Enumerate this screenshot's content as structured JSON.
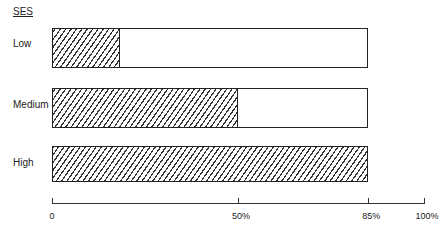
{
  "chart_data": {
    "type": "bar",
    "orientation": "horizontal",
    "title": "",
    "legend_title": "SES",
    "categories": [
      "Low",
      "Medium",
      "High"
    ],
    "series": [
      {
        "name": "hatched (filled)",
        "values": [
          18,
          50,
          85
        ]
      },
      {
        "name": "bar total",
        "values": [
          85,
          85,
          85
        ]
      }
    ],
    "xlabel": "",
    "ylabel": "SES",
    "xlim": [
      0,
      100
    ],
    "x_ticks": [
      0,
      50,
      85,
      100
    ],
    "x_tick_labels": [
      "0",
      "50%",
      "85%",
      "100%"
    ],
    "grid": false,
    "legend_position": "none"
  },
  "labels": {
    "legend_title": "SES",
    "categories": [
      "Low",
      "Medium",
      "High"
    ],
    "ticks": [
      "0",
      "50%",
      "85%",
      "100%"
    ]
  },
  "layout": {
    "axis_x0": 52,
    "axis_x100": 424,
    "bars": [
      {
        "top": 28,
        "height": 40
      },
      {
        "top": 88,
        "height": 40
      },
      {
        "top": 146,
        "height": 36
      }
    ],
    "label_tops": [
      36,
      97,
      154
    ]
  }
}
